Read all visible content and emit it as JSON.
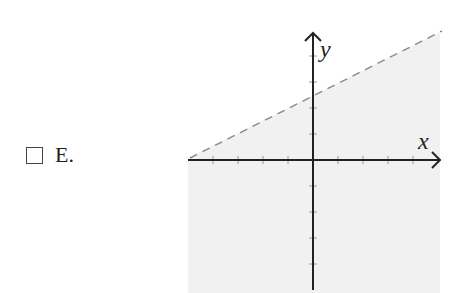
{
  "option": {
    "letter": "E.",
    "checked": false
  },
  "graph": {
    "x_axis_label": "x",
    "y_axis_label": "y",
    "boundary_line": {
      "style": "dashed",
      "slope": 0.5,
      "y_intercept": 2.5,
      "color": "#888888"
    },
    "shaded_region": "below",
    "shade_color": "#f1f1f1",
    "axis_color": "#222222",
    "x_ticks": [
      -4,
      -3,
      -2,
      -1,
      1,
      2,
      3,
      4
    ],
    "y_ticks": [
      -4,
      -3,
      -2,
      -1,
      1,
      2,
      3,
      4
    ]
  }
}
